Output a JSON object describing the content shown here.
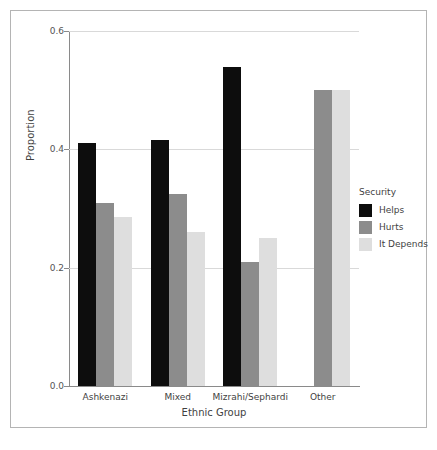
{
  "figure": {
    "caption": "",
    "background_color": "#ffffff",
    "frame_color": "#b4b4b4"
  },
  "axes": {
    "ylabel": "Proportion",
    "xlabel": "Ethnic Group",
    "yticks": [
      "0.0",
      "0.2",
      "0.4",
      "0.6"
    ],
    "ytick_values": [
      0.0,
      0.2,
      0.4,
      0.6
    ]
  },
  "legend": {
    "title": "Security",
    "entries": [
      {
        "label": "Helps",
        "color": "#0d0d0d"
      },
      {
        "label": "Hurts",
        "color": "#8c8c8c"
      },
      {
        "label": "It Depends",
        "color": "#dedede"
      }
    ]
  },
  "chart_data": {
    "type": "bar",
    "title": "",
    "xlabel": "Ethnic Group",
    "ylabel": "Proportion",
    "ylim": [
      0.0,
      0.6
    ],
    "grid": true,
    "legend_position": "right",
    "legend_title": "Security",
    "categories": [
      "Ashkenazi",
      "Mixed",
      "Mizrahi/Sephardi",
      "Other"
    ],
    "series": [
      {
        "name": "Helps",
        "color": "#0d0d0d",
        "values": [
          0.41,
          0.415,
          0.54,
          null
        ]
      },
      {
        "name": "Hurts",
        "color": "#8c8c8c",
        "values": [
          0.31,
          0.325,
          0.21,
          0.5
        ]
      },
      {
        "name": "It Depends",
        "color": "#dedede",
        "values": [
          0.285,
          0.26,
          0.25,
          0.5
        ]
      }
    ]
  }
}
